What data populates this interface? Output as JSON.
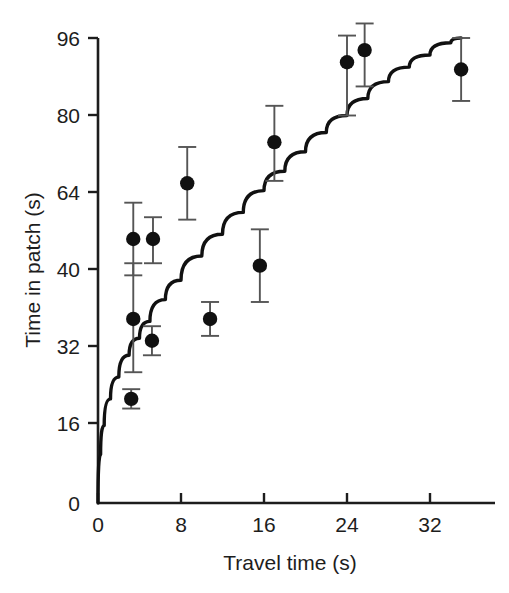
{
  "chart_data": {
    "type": "scatter",
    "title": "",
    "subtitle": "",
    "xlabel": "Travel time (s)",
    "ylabel": "Time in patch (s)",
    "xlim": [
      0,
      36
    ],
    "ylim": [
      0,
      96
    ],
    "xticks": [
      0,
      8,
      16,
      24,
      32
    ],
    "xticklabels": [
      "0",
      "8",
      "16",
      "24",
      "32"
    ],
    "yticks": [
      0,
      16,
      32,
      40,
      64,
      80,
      96
    ],
    "yticklabels": [
      "0",
      "16",
      "32",
      "40",
      "64",
      "80",
      "96"
    ],
    "grid": false,
    "legend": null,
    "marker": "filled-circle",
    "marker_color": "#111111",
    "errorbar_color": "#555555",
    "curve_color": "#111111",
    "points": [
      {
        "x": 3.2,
        "y": 21.5,
        "yerr_low": 19.5,
        "yerr_high": 23.5
      },
      {
        "x": 3.4,
        "y": 38.0,
        "yerr_low": 27.0,
        "yerr_high": 49.5
      },
      {
        "x": 3.4,
        "y": 54.5,
        "yerr_low": 47.0,
        "yerr_high": 62.0
      },
      {
        "x": 5.2,
        "y": 33.5,
        "yerr_low": 30.5,
        "yerr_high": 36.5
      },
      {
        "x": 5.3,
        "y": 54.5,
        "yerr_low": 49.5,
        "yerr_high": 59.0
      },
      {
        "x": 8.6,
        "y": 66.0,
        "yerr_low": 58.5,
        "yerr_high": 73.5
      },
      {
        "x": 10.8,
        "y": 38.0,
        "yerr_low": 34.5,
        "yerr_high": 41.5
      },
      {
        "x": 15.6,
        "y": 49.0,
        "yerr_low": 41.5,
        "yerr_high": 56.5
      },
      {
        "x": 17.0,
        "y": 74.5,
        "yerr_low": 66.5,
        "yerr_high": 82.0
      },
      {
        "x": 24.0,
        "y": 91.0,
        "yerr_low": 80.0,
        "yerr_high": 96.5
      },
      {
        "x": 25.7,
        "y": 93.5,
        "yerr_low": 86.0,
        "yerr_high": 99.0
      },
      {
        "x": 35.0,
        "y": 89.5,
        "yerr_low": 83.0,
        "yerr_high": 96.0
      }
    ],
    "curve": {
      "description": "fitted concave increasing curve through origin",
      "points": [
        {
          "x": 0.0,
          "y": 0.0
        },
        {
          "x": 0.25,
          "y": 10.0
        },
        {
          "x": 0.6,
          "y": 16.0
        },
        {
          "x": 1.2,
          "y": 21.5
        },
        {
          "x": 2.0,
          "y": 26.0
        },
        {
          "x": 3.0,
          "y": 30.5
        },
        {
          "x": 4.0,
          "y": 34.0
        },
        {
          "x": 5.0,
          "y": 37.5
        },
        {
          "x": 6.5,
          "y": 42.0
        },
        {
          "x": 8.0,
          "y": 46.0
        },
        {
          "x": 10.0,
          "y": 51.0
        },
        {
          "x": 12.0,
          "y": 55.5
        },
        {
          "x": 14.0,
          "y": 60.0
        },
        {
          "x": 16.0,
          "y": 64.5
        },
        {
          "x": 18.0,
          "y": 68.5
        },
        {
          "x": 20.0,
          "y": 72.5
        },
        {
          "x": 22.0,
          "y": 76.5
        },
        {
          "x": 24.0,
          "y": 80.0
        },
        {
          "x": 26.0,
          "y": 83.5
        },
        {
          "x": 28.0,
          "y": 87.0
        },
        {
          "x": 30.0,
          "y": 90.0
        },
        {
          "x": 32.0,
          "y": 92.5
        },
        {
          "x": 34.0,
          "y": 95.0
        },
        {
          "x": 35.0,
          "y": 96.0
        }
      ]
    }
  },
  "figure": {
    "xlabel": "Travel time (s)",
    "ylabel": "Time in patch (s)",
    "xticklabels": [
      "0",
      "8",
      "16",
      "24",
      "32"
    ],
    "yticklabels": [
      "96",
      "80",
      "64",
      "40",
      "32",
      "16",
      "0"
    ]
  }
}
